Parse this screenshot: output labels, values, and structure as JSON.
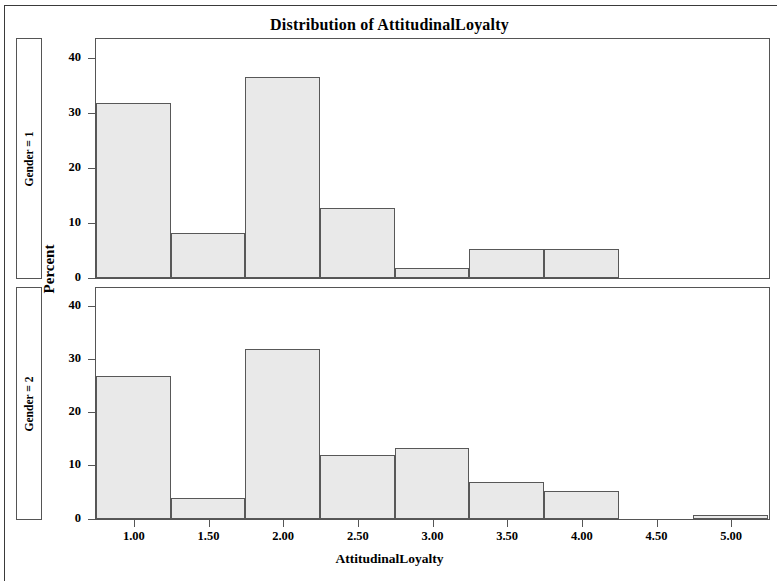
{
  "figure": {
    "title": "Distribution of AttitudinalLoyalty",
    "xlabel": "AttitudinalLoyalty",
    "ylabel": "Percent"
  },
  "panels": [
    {
      "label": "Gender = 1"
    },
    {
      "label": "Gender = 2"
    }
  ],
  "axes": {
    "y_ticks": [
      "0",
      "10",
      "20",
      "30",
      "40"
    ],
    "x_ticks": [
      "1.00",
      "1.50",
      "2.00",
      "2.50",
      "3.00",
      "3.50",
      "4.00",
      "4.50",
      "5.00"
    ]
  },
  "colors": {
    "bar_fill": "#e9e9e9",
    "bar_border": "#585858",
    "axis": "#555555",
    "text": "#000000",
    "background": "#ffffff"
  },
  "chart_data": {
    "type": "bar",
    "title": "Distribution of AttitudinalLoyalty",
    "xlabel": "AttitudinalLoyalty",
    "ylabel": "Percent",
    "subplot_layout": "2 rows x 1 column (panelled histogram)",
    "grid": false,
    "legend": null,
    "bin_width": 0.5,
    "xlim": [
      0.75,
      5.25
    ],
    "ylim": [
      0,
      43
    ],
    "x_tick_values": [
      1.0,
      1.5,
      2.0,
      2.5,
      3.0,
      3.5,
      4.0,
      4.5,
      5.0
    ],
    "y_tick_values": [
      0,
      10,
      20,
      30,
      40
    ],
    "bin_centers": [
      1.0,
      1.5,
      2.0,
      2.5,
      3.0,
      3.5,
      4.0,
      4.5,
      5.0
    ],
    "bin_edges": [
      0.75,
      1.25,
      1.75,
      2.25,
      2.75,
      3.25,
      3.75,
      4.25,
      4.75,
      5.25
    ],
    "series": [
      {
        "name": "Gender = 1",
        "panel_label": "Gender = 1",
        "values": [
          31.9,
          8.1,
          36.6,
          12.7,
          1.9,
          5.3,
          5.3,
          0,
          0
        ]
      },
      {
        "name": "Gender = 2",
        "panel_label": "Gender = 2",
        "values": [
          27.0,
          3.9,
          32.1,
          12.0,
          13.3,
          6.9,
          5.3,
          0,
          0.8
        ]
      }
    ]
  },
  "geometry": {
    "panel1": {
      "left": 95,
      "top": 38,
      "width": 675,
      "height": 241,
      "y_max": 43.3
    },
    "panel2": {
      "left": 95,
      "top": 287,
      "width": 675,
      "height": 233,
      "y_max": 43.3
    },
    "x_min": 0.75,
    "x_max": 5.25
  }
}
